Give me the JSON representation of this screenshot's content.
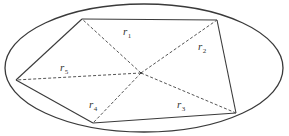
{
  "diagram": {
    "ellipse": {
      "cx": 144,
      "cy": 68,
      "rx": 139,
      "ry": 64
    },
    "center_point": {
      "x": 141,
      "y": 73
    },
    "vertices": [
      {
        "id": "A",
        "x": 82,
        "y": 19
      },
      {
        "id": "B",
        "x": 217,
        "y": 20
      },
      {
        "id": "E",
        "x": 236,
        "y": 113
      },
      {
        "id": "D",
        "x": 93,
        "y": 123
      },
      {
        "id": "C",
        "x": 16,
        "y": 80
      }
    ],
    "labels": [
      {
        "main": "r",
        "sub": "1",
        "x": 123,
        "y": 35
      },
      {
        "main": "r",
        "sub": "2",
        "x": 198,
        "y": 50
      },
      {
        "main": "r",
        "sub": "3",
        "x": 177,
        "y": 108
      },
      {
        "main": "r",
        "sub": "4",
        "x": 89,
        "y": 108
      },
      {
        "main": "r",
        "sub": "5",
        "x": 60,
        "y": 71
      }
    ],
    "colors": {
      "stroke": "#3a3a3a",
      "dashed": "#555555",
      "text": "#333333",
      "background": "#ffffff"
    }
  }
}
